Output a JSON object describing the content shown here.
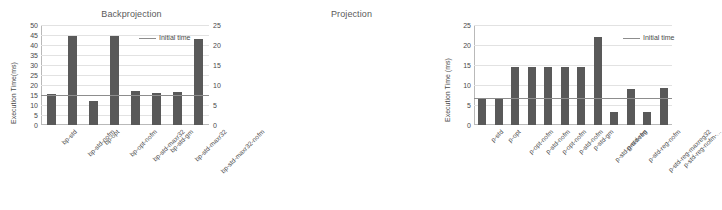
{
  "chart_data": [
    {
      "type": "bar",
      "title": "Backprojection",
      "xlabel": "",
      "ylabel": "Execution Time(ms)",
      "ylim": [
        0,
        50
      ],
      "yticks": [
        0,
        5,
        10,
        15,
        20,
        25,
        30,
        35,
        40,
        45,
        50
      ],
      "grid": true,
      "legend_position": "top-right",
      "legend": [
        "Initial time"
      ],
      "bar_color": "#595959",
      "line_color": "#8d8d8d",
      "initial_time": 15.2,
      "categories": [
        "bp-std",
        "bp-std-nofm",
        "bp-opt",
        "bp-opt-nofm",
        "bp-std-maxr32",
        "bp-std-gm",
        "bp-std-maxr32",
        "bp-std-maxr32-nofm"
      ],
      "values": [
        15.4,
        44.4,
        12.0,
        44.4,
        16.9,
        16.0,
        16.7,
        43.2
      ]
    },
    {
      "type": "bar",
      "title": "Projection",
      "xlabel": "",
      "ylabel": "Execution Time (ms)",
      "ylim": [
        0,
        25
      ],
      "yticks": [
        0,
        5,
        10,
        15,
        20,
        25
      ],
      "grid": true,
      "legend_position": "top-right",
      "legend": [
        "Initial time"
      ],
      "bar_color": "#595959",
      "line_color": "#8d8d8d",
      "initial_time": 6.8,
      "categories": [
        "p-std",
        "p-opt",
        "p-opt-nofm",
        "p-std-nofm",
        "p-opt-nofm",
        "p-std-nofm",
        "p-std-gm",
        "p-std-gm-nofm",
        "p-std-reg",
        "p-std-reg-nofm",
        "p-std-reg-maxreg32",
        "p-std-reg-nofm-..."
      ],
      "values": [
        6.8,
        6.8,
        14.4,
        14.4,
        14.4,
        14.4,
        14.6,
        21.9,
        3.2,
        8.9,
        3.2,
        9.2
      ]
    }
  ]
}
